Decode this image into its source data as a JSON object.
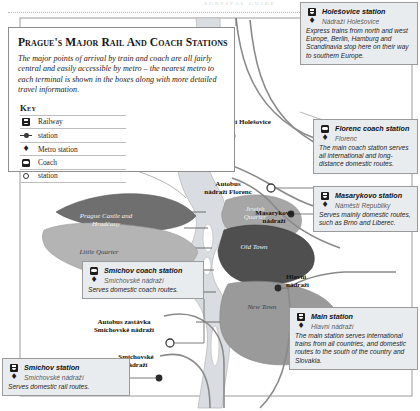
{
  "page": {
    "running_header": "SURVIVAL  GUIDE",
    "title": "Prague's Major Rail and Coach Stations",
    "intro": "The major points of arrival by train and coach are all fairly central and easily accessible by metro – the nearest metro to each terminal is shown in the boxes along with more detailed travel information."
  },
  "key": {
    "heading": "Key",
    "items": [
      {
        "icon": "railway-icon",
        "label": "Railway"
      },
      {
        "icon": "rail-station-icon",
        "label": "station"
      },
      {
        "icon": "metro-icon",
        "label": "Metro station"
      },
      {
        "icon": "coach-icon",
        "label": "Coach"
      },
      {
        "icon": "coach-station-icon",
        "label": "station"
      }
    ]
  },
  "callouts": [
    {
      "id": "holesovice",
      "icon": "railway-icon",
      "metro_icon": "metro-icon",
      "title": "Holešovice station",
      "subtitle": "Nádraží Holešovice",
      "body": "Express trains from north and west Europe, Berlin, Hamburg and Scandinavia stop here on their way to southern Europe."
    },
    {
      "id": "florenc",
      "icon": "coach-icon",
      "metro_icon": "metro-icon",
      "title": "Florenc coach station",
      "subtitle": "Florenc",
      "body": "The main coach station serves all international and long-distance domestic routes."
    },
    {
      "id": "masarykovo",
      "icon": "railway-icon",
      "metro_icon": "metro-icon",
      "title": "Masarykovo station",
      "subtitle": "Náměstí Republiky",
      "body": "Serves mainly domestic routes, such as Brno and Liberec."
    },
    {
      "id": "main",
      "icon": "railway-icon",
      "metro_icon": "metro-icon",
      "title": "Main station",
      "subtitle": "Hlavní nádraží",
      "body": "The main station serves international trains from all countries, and domestic routes to the south of the country and Slovakia."
    },
    {
      "id": "smichov-coach",
      "icon": "coach-icon",
      "metro_icon": "metro-icon",
      "title": "Smíchov coach station",
      "subtitle": "Smíchovské nádraží",
      "body": "Serves domestic coach routes."
    },
    {
      "id": "smichov",
      "icon": "railway-icon",
      "metro_icon": "metro-icon",
      "title": "Smíchov station",
      "subtitle": "Smíchovské nádraží",
      "body": "Serves domestic rail routes."
    }
  ],
  "map": {
    "station_labels": [
      {
        "id": "holesovice",
        "text": "Nádraží Holešovice"
      },
      {
        "id": "florenc",
        "line1": "Autobus",
        "line2": "nádraží Florenc"
      },
      {
        "id": "masarykovo",
        "line1": "Masarykovo",
        "line2": "nádraží"
      },
      {
        "id": "hlavni",
        "line1": "Hlavní",
        "line2": "nádraží"
      },
      {
        "id": "smichov-bus",
        "line1": "Autobus zastávka",
        "line2": "Smíchovské nádraží"
      },
      {
        "id": "smichov-rail",
        "line1": "Smíchovské",
        "line2": "nádraží"
      }
    ],
    "districts": [
      {
        "id": "hradcany",
        "line1": "Prague Castle and",
        "line2": "Hradčany"
      },
      {
        "id": "little-quarter",
        "line1": "Little Quarter",
        "line2": ""
      },
      {
        "id": "jewish-quarter",
        "line1": "Jewish",
        "line2": "Quarter"
      },
      {
        "id": "old-town",
        "line1": "Old Town",
        "line2": ""
      },
      {
        "id": "new-town",
        "line1": "New Town",
        "line2": ""
      }
    ]
  },
  "colors": {
    "callout_bg": "#e9ecef",
    "river": "#d9dde1",
    "district_hradcany": "#6f6f6f",
    "district_little_quarter": "#b4b4b4",
    "district_jewish": "#a6a6a6",
    "district_old_town": "#4f4f4f",
    "district_new_town": "#9a9a9a",
    "rail_line": "#8a8a8a"
  }
}
